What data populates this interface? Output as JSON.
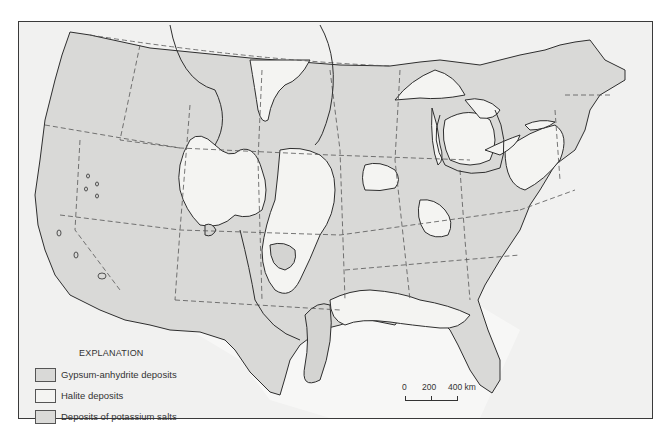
{
  "map": {
    "subject": "Evaporite deposits of the conterminous United States",
    "colors": {
      "gypsum_anhydrite": "#d9d9d7",
      "halite": "#f4f4f2",
      "potassium_salts": "#dadad8",
      "background": "#f1f1f0",
      "ocean_light": "#f6f6f5",
      "frame": "#3a3a3a",
      "line": "#2e2e2e"
    }
  },
  "legend": {
    "title": "EXPLANATION",
    "items": [
      {
        "label": "Gypsum-anhydrite deposits",
        "swatch": "#d9d9d7"
      },
      {
        "label": "Halite deposits",
        "swatch": "#f4f4f2"
      },
      {
        "label": "Deposits of potassium salts",
        "swatch": "#dadad8"
      }
    ]
  },
  "scale_bar": {
    "ticks": [
      "0",
      "200",
      "400 km"
    ],
    "unit": "km"
  }
}
